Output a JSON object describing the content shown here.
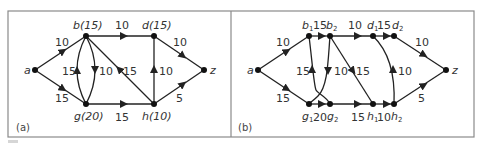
{
  "figure": {
    "panels": [
      {
        "tag": "(a)",
        "nodes": [
          {
            "id": "a",
            "label": "a",
            "x": 35,
            "y": 70
          },
          {
            "id": "b",
            "label": "b(15)",
            "x": 86,
            "y": 36
          },
          {
            "id": "g",
            "label": "g(20)",
            "x": 86,
            "y": 104
          },
          {
            "id": "d",
            "label": "d(15)",
            "x": 154,
            "y": 36
          },
          {
            "id": "h",
            "label": "h(10)",
            "x": 154,
            "y": 104
          },
          {
            "id": "z",
            "label": "z",
            "x": 204,
            "y": 70
          }
        ],
        "edges": [
          {
            "from": "a",
            "to": "b",
            "weight": "10"
          },
          {
            "from": "a",
            "to": "g",
            "weight": "15"
          },
          {
            "from": "g",
            "to": "b",
            "weight": "15"
          },
          {
            "from": "b",
            "to": "g",
            "weight": "10"
          },
          {
            "from": "b",
            "to": "d",
            "weight": "10"
          },
          {
            "from": "h",
            "to": "b",
            "weight": "15"
          },
          {
            "from": "g",
            "to": "h",
            "weight": "15"
          },
          {
            "from": "h",
            "to": "d",
            "weight": "10"
          },
          {
            "from": "d",
            "to": "z",
            "weight": "10"
          },
          {
            "from": "h",
            "to": "z",
            "weight": "5"
          }
        ]
      },
      {
        "tag": "(b)",
        "nodes": [
          {
            "id": "a",
            "label": "a",
            "x": 258,
            "y": 70
          },
          {
            "id": "b1",
            "label": "b",
            "sub": "1",
            "x": 309,
            "y": 36
          },
          {
            "id": "b2",
            "label": "b",
            "sub": "2",
            "x": 330,
            "y": 36
          },
          {
            "id": "d1",
            "label": "d",
            "sub": "1",
            "x": 373,
            "y": 36
          },
          {
            "id": "d2",
            "label": "d",
            "sub": "2",
            "x": 394,
            "y": 36
          },
          {
            "id": "g1",
            "label": "g",
            "sub": "1",
            "x": 309,
            "y": 104
          },
          {
            "id": "g2",
            "label": "g",
            "sub": "2",
            "x": 330,
            "y": 104
          },
          {
            "id": "h1",
            "label": "h",
            "sub": "1",
            "x": 373,
            "y": 104
          },
          {
            "id": "h2",
            "label": "h",
            "sub": "2",
            "x": 394,
            "y": 104
          },
          {
            "id": "z",
            "label": "z",
            "x": 446,
            "y": 70
          }
        ],
        "edges": [
          {
            "from": "a",
            "to": "b1",
            "weight": "10"
          },
          {
            "from": "a",
            "to": "g1",
            "weight": "15"
          },
          {
            "from": "b1",
            "to": "b2",
            "weight": "15"
          },
          {
            "from": "b2",
            "to": "d1",
            "weight": "10"
          },
          {
            "from": "d1",
            "to": "d2",
            "weight": "15"
          },
          {
            "from": "g1",
            "to": "g2",
            "weight": "20"
          },
          {
            "from": "g2",
            "to": "h1",
            "weight": "15"
          },
          {
            "from": "h1",
            "to": "h2",
            "weight": "10"
          },
          {
            "from": "g2",
            "to": "b1",
            "weight": "15"
          },
          {
            "from": "b2",
            "to": "g1",
            "weight": "10"
          },
          {
            "from": "b2",
            "to": "h1",
            "weight": "15"
          },
          {
            "from": "h2",
            "to": "d1",
            "weight": "10"
          },
          {
            "from": "d2",
            "to": "z",
            "weight": "10"
          },
          {
            "from": "h2",
            "to": "z",
            "weight": "5"
          }
        ]
      }
    ],
    "labels": {
      "a_a": "a",
      "a_b": "b(15)",
      "a_d": "d(15)",
      "a_g": "g(20)",
      "a_h": "h(10)",
      "a_z": "z",
      "a_w_ab": "10",
      "a_w_ag": "15",
      "a_w_gb": "15",
      "a_w_bg": "10",
      "a_w_bd": "10",
      "a_w_hb": "15",
      "a_w_gh": "15",
      "a_w_hd": "10",
      "a_w_dz": "10",
      "a_w_hz": "5",
      "b_a": "a",
      "b_z": "z",
      "b_b": "b",
      "b_d": "d",
      "b_g": "g",
      "b_h": "h",
      "s1": "1",
      "s2": "2",
      "b_w_ab1": "10",
      "b_w_ag1": "15",
      "b_w_b1b2": "15",
      "b_w_b2d1": "10",
      "b_w_d1d2": "15",
      "b_w_g1g2": "20",
      "b_w_g2h1": "15",
      "b_w_h1h2": "10",
      "b_w_g2b1": "15",
      "b_w_b2g1": "10",
      "b_w_b2h1": "15",
      "b_w_h2d1": "10",
      "b_w_d2z": "10",
      "b_w_h2z": "5",
      "tag_a": "(a)",
      "tag_b": "(b)"
    },
    "colors": {
      "edge": "#222222",
      "node": "#111111",
      "text": "#333333",
      "border": "#8a8a8a"
    }
  }
}
